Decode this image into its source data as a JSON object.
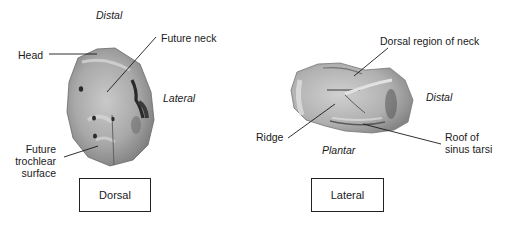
{
  "figure": {
    "panels": [
      {
        "id": "dorsal",
        "view_label": "Dorsal",
        "orientation_labels": {
          "top": "Distal",
          "right": "Lateral"
        },
        "annotations": [
          {
            "label": "Head"
          },
          {
            "label": "Future neck"
          },
          {
            "label_lines": [
              "Future",
              "trochlear",
              "surface"
            ]
          }
        ]
      },
      {
        "id": "lateral",
        "view_label": "Lateral",
        "orientation_labels": {
          "right": "Distal",
          "bottom": "Plantar"
        },
        "annotations": [
          {
            "label": "Dorsal region of neck"
          },
          {
            "label": "Ridge"
          },
          {
            "label_lines": [
              "Roof of",
              "sinus tarsi"
            ]
          }
        ]
      }
    ]
  }
}
